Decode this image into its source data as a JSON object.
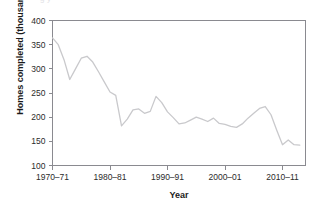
{
  "figure": {
    "cropped_title_fragment": "g  y",
    "axis_color": "#8a8a90",
    "line_color": "#c9c9cc",
    "text_color": "#1b1b1b"
  },
  "chart_data": {
    "type": "line",
    "title": "",
    "xlabel": "Year",
    "ylabel": "Homes completed (thousands)",
    "ylim": [
      100,
      400
    ],
    "yticks": [
      100,
      150,
      200,
      250,
      300,
      350,
      400
    ],
    "ytick_labels": [
      "100",
      "150",
      "200",
      "250",
      "300",
      "350",
      "400"
    ],
    "xlim": [
      1970,
      2014
    ],
    "xticks": [
      1970,
      1980,
      1990,
      2000,
      2010
    ],
    "xtick_labels": [
      "1970–71",
      "1980–81",
      "1990–91",
      "2000–01",
      "2010–11"
    ],
    "grid": false,
    "legend": "none",
    "series": [
      {
        "name": "Homes completed",
        "color": "#c9c9cc",
        "x": [
          1970,
          1971,
          1972,
          1973,
          1974,
          1975,
          1976,
          1977,
          1978,
          1979,
          1980,
          1981,
          1982,
          1983,
          1984,
          1985,
          1986,
          1987,
          1988,
          1989,
          1990,
          1991,
          1992,
          1993,
          1994,
          1995,
          1996,
          1997,
          1998,
          1999,
          2000,
          2001,
          2002,
          2003,
          2004,
          2005,
          2006,
          2007,
          2008,
          2009,
          2010,
          2011,
          2012,
          2013
        ],
        "values": [
          364,
          350,
          319,
          278,
          300,
          322,
          326,
          314,
          294,
          273,
          252,
          245,
          182,
          196,
          215,
          217,
          208,
          212,
          243,
          230,
          211,
          199,
          186,
          188,
          194,
          200,
          196,
          191,
          198,
          187,
          185,
          181,
          179,
          186,
          198,
          208,
          218,
          222,
          205,
          173,
          143,
          153,
          143,
          142
        ]
      }
    ]
  }
}
